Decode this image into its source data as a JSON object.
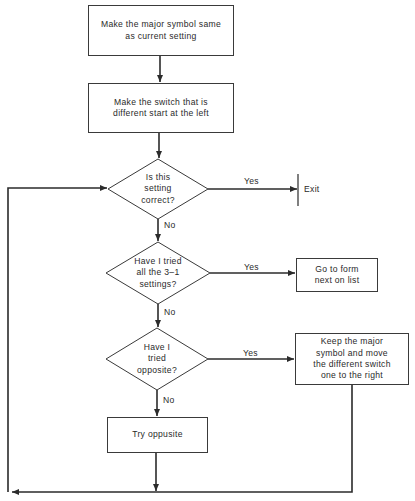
{
  "diagram": {
    "type": "flowchart",
    "nodes": {
      "step1": {
        "shape": "rectangle",
        "text": "Make the major symbol same as current setting",
        "lines": [
          "Make the major symbol same",
          "as current setting"
        ]
      },
      "step2": {
        "shape": "rectangle",
        "text": "Make the switch that is different start at the left",
        "lines": [
          "Make the switch that is",
          "different start at the left"
        ]
      },
      "decision1": {
        "shape": "diamond",
        "text": "Is this setting correct?",
        "lines": [
          "Is this",
          "setting",
          "correct?"
        ]
      },
      "exit": {
        "shape": "terminal-bar",
        "text": "Exit"
      },
      "decision2": {
        "shape": "diamond",
        "text": "Have I tried all the 3–1 settings?",
        "lines": [
          "Have I tried",
          "all the 3–1",
          "settings?"
        ]
      },
      "goto_form": {
        "shape": "rectangle",
        "text": "Go to form next on list",
        "lines": [
          "Go to form",
          "next on list"
        ]
      },
      "decision3": {
        "shape": "diamond",
        "text": "Have I tried opposite?",
        "lines": [
          "Have I",
          "tried",
          "opposite?"
        ]
      },
      "keep_major": {
        "shape": "rectangle",
        "text": "Keep the major symbol and move the different switch one to the right",
        "lines": [
          "Keep the major",
          "symbol and move",
          "the different switch",
          "one to the right"
        ]
      },
      "try_opposite": {
        "shape": "rectangle",
        "text": "Try oppusite",
        "lines": [
          "Try oppusite"
        ]
      }
    },
    "edges": [
      {
        "from": "step1",
        "to": "step2",
        "label": ""
      },
      {
        "from": "step2",
        "to": "decision1",
        "label": ""
      },
      {
        "from": "decision1",
        "to": "exit",
        "label": "Yes"
      },
      {
        "from": "decision1",
        "to": "decision2",
        "label": "No"
      },
      {
        "from": "decision2",
        "to": "goto_form",
        "label": "Yes"
      },
      {
        "from": "decision2",
        "to": "decision3",
        "label": "No"
      },
      {
        "from": "decision3",
        "to": "keep_major",
        "label": "Yes"
      },
      {
        "from": "decision3",
        "to": "try_opposite",
        "label": "No"
      },
      {
        "from": "try_opposite",
        "to": "decision1",
        "label": "",
        "route": "loop-back-left"
      },
      {
        "from": "keep_major",
        "to": "decision1",
        "label": "",
        "route": "loop-back-left"
      }
    ],
    "labels": {
      "yes": "Yes",
      "no": "No"
    },
    "colors": {
      "line": "#2b2b2b",
      "background": "#ffffff",
      "text": "#2a2a2a"
    }
  }
}
